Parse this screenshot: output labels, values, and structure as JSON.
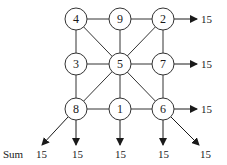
{
  "diagram": {
    "type": "magic-square-graph",
    "grid": [
      [
        4,
        9,
        2
      ],
      [
        3,
        5,
        7
      ],
      [
        8,
        1,
        6
      ]
    ],
    "nodes": [
      {
        "id": "n4",
        "label": "4",
        "col": 0,
        "row": 0
      },
      {
        "id": "n9",
        "label": "9",
        "col": 1,
        "row": 0
      },
      {
        "id": "n2",
        "label": "2",
        "col": 2,
        "row": 0
      },
      {
        "id": "n3",
        "label": "3",
        "col": 0,
        "row": 1
      },
      {
        "id": "n5",
        "label": "5",
        "col": 1,
        "row": 1
      },
      {
        "id": "n7",
        "label": "7",
        "col": 2,
        "row": 1
      },
      {
        "id": "n8",
        "label": "8",
        "col": 0,
        "row": 2
      },
      {
        "id": "n1",
        "label": "1",
        "col": 1,
        "row": 2
      },
      {
        "id": "n6",
        "label": "6",
        "col": 2,
        "row": 2
      }
    ],
    "row_sums": [
      "15",
      "15",
      "15"
    ],
    "bottom_sums": [
      "15",
      "15",
      "15",
      "15",
      "15"
    ],
    "sum_label": "Sum"
  }
}
